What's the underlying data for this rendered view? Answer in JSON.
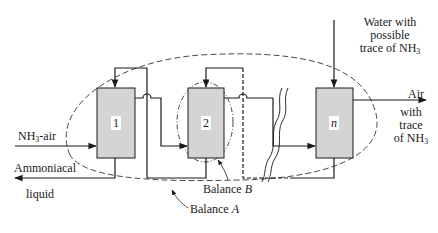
{
  "diagram": {
    "units": [
      {
        "id": "1",
        "label": "1"
      },
      {
        "id": "2",
        "label": "2"
      },
      {
        "id": "n",
        "label": "n"
      }
    ],
    "streams": {
      "gas_in": {
        "prefix": "NH",
        "sub": "3",
        "suffix": "-air"
      },
      "liquid_out": {
        "line1": "Ammoniacal",
        "line2": "liquid"
      },
      "water_in": {
        "line1": "Water with",
        "line2": "possible",
        "line3_prefix": "trace of NH",
        "line3_sub": "3"
      },
      "air_out": {
        "line1": "Air",
        "line2": "with",
        "line3": "trace",
        "line4_prefix": "of NH",
        "line4_sub": "3"
      }
    },
    "balances": {
      "A": {
        "prefix": "Balance ",
        "letter": "A"
      },
      "B": {
        "prefix": "Balance ",
        "letter": "B"
      }
    },
    "colors": {
      "box_fill": "#d4d4d4",
      "line": "#1a1a1a",
      "background": "#ffffff"
    }
  }
}
